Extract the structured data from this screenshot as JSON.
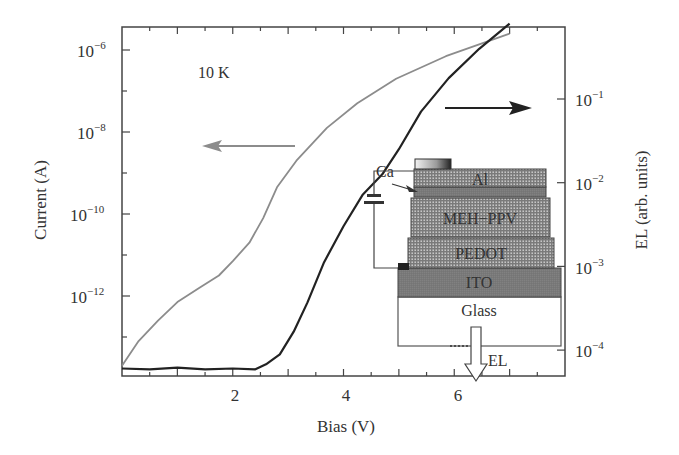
{
  "chart_data": {
    "type": "line",
    "title": "",
    "annotation": "10 K",
    "xlabel": "Bias (V)",
    "ylabel_left": "Current (A)",
    "ylabel_right": "EL (arb. units)",
    "xlim": [
      0,
      8
    ],
    "ylim_left_log10": [
      -13.85,
      -5.7
    ],
    "ylim_right_log10": [
      -4.3,
      0.9
    ],
    "x_ticks": [
      {
        "value": 2,
        "label": "2"
      },
      {
        "value": 4,
        "label": "4"
      },
      {
        "value": 6,
        "label": "6"
      }
    ],
    "y_left_ticks": [
      {
        "exp": -6,
        "base": "10",
        "sup": "−6"
      },
      {
        "exp": -8,
        "base": "10",
        "sup": "−8"
      },
      {
        "exp": -10,
        "base": "10",
        "sup": "−10"
      },
      {
        "exp": -12,
        "base": "10",
        "sup": "−12"
      }
    ],
    "y_right_ticks": [
      {
        "exp": -1,
        "base": "10",
        "sup": "−1"
      },
      {
        "exp": -2,
        "base": "10",
        "sup": "−2"
      },
      {
        "exp": -3,
        "base": "10",
        "sup": "−3"
      },
      {
        "exp": -4,
        "base": "10",
        "sup": "−4"
      }
    ],
    "series": [
      {
        "name": "Current",
        "axis": "left",
        "color": "#8c8c8c",
        "x": [
          0.0,
          0.3,
          0.65,
          1.0,
          1.4,
          1.75,
          2.0,
          2.3,
          2.55,
          2.8,
          3.15,
          3.7,
          4.25,
          4.95,
          5.85,
          7.0
        ],
        "log10": [
          -13.7,
          -13.1,
          -12.6,
          -12.15,
          -11.8,
          -11.5,
          -11.15,
          -10.7,
          -10.1,
          -9.35,
          -8.7,
          -7.9,
          -7.3,
          -6.7,
          -6.15,
          -5.6
        ]
      },
      {
        "name": "EL",
        "axis": "right",
        "color": "#222222",
        "x": [
          0.0,
          0.5,
          1.0,
          1.5,
          2.0,
          2.4,
          2.6,
          2.85,
          3.1,
          3.35,
          3.65,
          4.0,
          4.35,
          4.7,
          5.0,
          5.4,
          5.9,
          6.45,
          7.0
        ],
        "log10": [
          -4.22,
          -4.23,
          -4.21,
          -4.23,
          -4.22,
          -4.23,
          -4.17,
          -4.05,
          -3.78,
          -3.43,
          -2.95,
          -2.52,
          -2.14,
          -1.9,
          -1.6,
          -1.15,
          -0.75,
          -0.4,
          -0.1
        ]
      }
    ],
    "arrows": [
      {
        "points_to": "left axis",
        "color": "#8c8c8c"
      },
      {
        "points_to": "right axis",
        "color": "#222222"
      }
    ],
    "inset": {
      "type": "device-structure",
      "layers": [
        "Al",
        "Ca",
        "MEH−PPV",
        "PEDOT",
        "ITO",
        "Glass"
      ],
      "emission_label": "EL"
    }
  },
  "labels": {
    "temp": "10 K",
    "xlabel": "Bias (V)",
    "ylabel_left": "Current (A)",
    "ylabel_right": "EL (arb. units)",
    "ca": "Ca",
    "al": "Al",
    "meh": "MEH−PPV",
    "pedot": "PEDOT",
    "ito": "ITO",
    "glass": "Glass",
    "el": "EL",
    "x2": "2",
    "x4": "4",
    "x6": "6",
    "ten": "10",
    "l6": "−6",
    "l8": "−8",
    "l10": "−10",
    "l12": "−12",
    "r1": "−1",
    "r2": "−2",
    "r3": "−3",
    "r4": "−4"
  }
}
